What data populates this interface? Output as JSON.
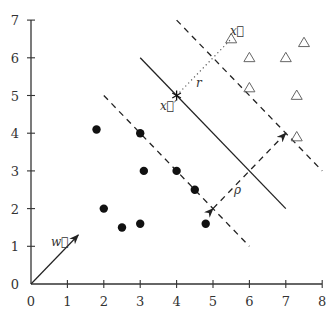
{
  "figure": {
    "x_ticks": [
      "0",
      "1",
      "2",
      "3",
      "4",
      "5",
      "6",
      "7",
      "8"
    ],
    "y_ticks": [
      "0",
      "1",
      "2",
      "3",
      "4",
      "5",
      "6",
      "7"
    ],
    "labels": {
      "w": "w⃗",
      "x": "x⃗",
      "x_prime": "x⃗′",
      "r": "r",
      "rho": "ρ"
    }
  },
  "chart_data": {
    "type": "scatter",
    "title": "",
    "xlabel": "",
    "ylabel": "",
    "xlim": [
      0,
      8
    ],
    "ylim": [
      0,
      7
    ],
    "grid": false,
    "series": [
      {
        "name": "class-circles",
        "marker": "filled-circle",
        "points": [
          [
            1.8,
            4.1
          ],
          [
            3,
            4
          ],
          [
            3.1,
            3
          ],
          [
            4,
            3
          ],
          [
            4.5,
            2.5
          ],
          [
            2,
            2
          ],
          [
            2.5,
            1.5
          ],
          [
            3,
            1.6
          ],
          [
            4.8,
            1.6
          ]
        ]
      },
      {
        "name": "class-triangles",
        "marker": "open-triangle",
        "points": [
          [
            5.5,
            6.5
          ],
          [
            6,
            6
          ],
          [
            7,
            6
          ],
          [
            7.5,
            6.4
          ],
          [
            6,
            5.2
          ],
          [
            7.3,
            5
          ],
          [
            7.3,
            3.9
          ]
        ]
      }
    ],
    "lines": [
      {
        "name": "decision-boundary",
        "style": "solid",
        "from": [
          3,
          6
        ],
        "to": [
          7,
          2
        ]
      },
      {
        "name": "margin-lower",
        "style": "dashed",
        "from": [
          2,
          5
        ],
        "to": [
          6,
          1
        ]
      },
      {
        "name": "margin-upper",
        "style": "dashed",
        "from": [
          4,
          7
        ],
        "to": [
          8,
          3
        ]
      },
      {
        "name": "margin-width-rho",
        "style": "dashed-double-arrow",
        "from": [
          5,
          2
        ],
        "to": [
          7,
          4
        ],
        "label": "ρ"
      },
      {
        "name": "distance-r",
        "style": "dotted",
        "from": [
          4,
          5
        ],
        "to": [
          5.5,
          6.5
        ],
        "label": "r"
      },
      {
        "name": "weight-vector-w",
        "style": "arrow",
        "from": [
          0,
          0
        ],
        "to": [
          1.3,
          1.3
        ],
        "label": "w⃗"
      }
    ],
    "annotations": [
      {
        "text": "x⃗",
        "at": [
          5.5,
          6.5
        ]
      },
      {
        "text": "x⃗′",
        "at": [
          4,
          5
        ],
        "marker": "star"
      }
    ]
  }
}
